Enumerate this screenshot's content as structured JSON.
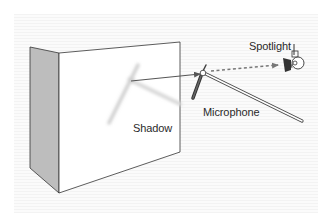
{
  "diagram": {
    "labels": {
      "spotlight": "Spotlight",
      "microphone": "Microphone",
      "shadow": "Shadow"
    },
    "colors": {
      "outline": "#333333",
      "wall_side": "#bdbdbd",
      "wall_front": "#ffffff",
      "shadow": "#d0d0d0",
      "arrow": "#555555",
      "dotted_arrow": "#777777"
    }
  }
}
